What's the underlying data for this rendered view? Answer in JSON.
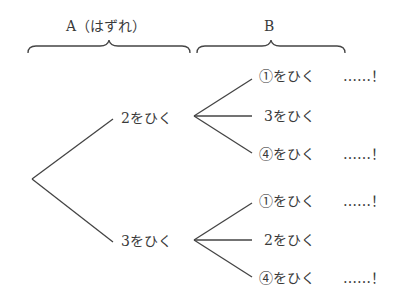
{
  "headers": {
    "a": "A（はずれ）",
    "b": "B"
  },
  "tree": {
    "level1": [
      {
        "label": "2をひく",
        "children": [
          {
            "label": "①をひく",
            "mark": "……！"
          },
          {
            "label": "3をひく",
            "mark": ""
          },
          {
            "label": "④をひく",
            "mark": "……！"
          }
        ]
      },
      {
        "label": "3をひく",
        "children": [
          {
            "label": "①をひく",
            "mark": "……！"
          },
          {
            "label": "2をひく",
            "mark": ""
          },
          {
            "label": "④をひく",
            "mark": "……！"
          }
        ]
      }
    ]
  }
}
